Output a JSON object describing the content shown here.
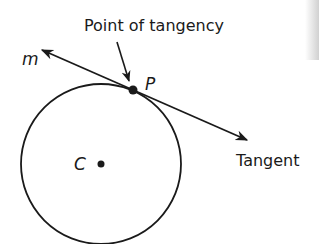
{
  "diagram": {
    "title_label": "Point of tangency",
    "line_label": "m",
    "point_label": "P",
    "center_label": "C",
    "tangent_label": "Tangent",
    "colors": {
      "stroke": "#1a1a1a",
      "background": "#ffffff"
    },
    "geometry": {
      "circle": {
        "cx": 101,
        "cy": 164,
        "r": 80
      },
      "center_point": {
        "x": 101,
        "y": 164
      },
      "tangent_point": {
        "x": 133,
        "y": 90
      },
      "tangent_line": {
        "x1": 42,
        "y1": 50,
        "x2": 247,
        "y2": 140
      },
      "pointer_arrow": {
        "x1": 117,
        "y1": 42,
        "x2": 129,
        "y2": 81
      }
    }
  }
}
